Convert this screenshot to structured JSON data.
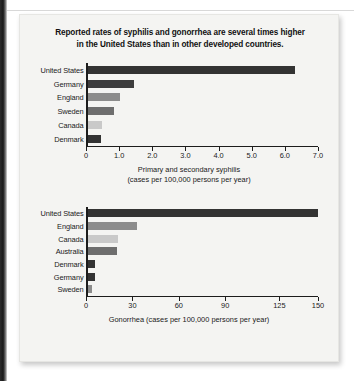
{
  "figure": {
    "title": "Reported rates of syphilis and gonorrhea are several times higher in the United States than in other developed countries.",
    "title_line1": "Reported rates of syphilis and gonorrhea are several times higher",
    "title_line2": "in the United States than in other developed countries."
  },
  "colors": {
    "background_card": "#f4f4f2",
    "page_background": "#ffffff",
    "axis": "#1c1c1c",
    "text": "#1a1a1a",
    "bar_darkest": "#333333",
    "bar_dark": "#3d3d3d",
    "bar_medium": "#8c8c8c",
    "bar_light": "#c9c9c9",
    "bar_mid_dark": "#6e6e6e"
  },
  "chart_data": [
    {
      "id": "syphilis",
      "type": "bar",
      "orientation": "horizontal",
      "title": "",
      "xlabel_line1": "Primary and secondary syphilis",
      "xlabel_line2": "(cases per 100,000 persons per year)",
      "ylabel": "",
      "categories": [
        "United States",
        "Germany",
        "England",
        "Sweden",
        "Canada",
        "Denmark"
      ],
      "values": [
        6.3,
        1.4,
        1.0,
        0.8,
        0.45,
        0.4
      ],
      "bar_colors": [
        "#333333",
        "#3d3d3d",
        "#8c8c8c",
        "#6e6e6e",
        "#c9c9c9",
        "#333333"
      ],
      "xlim": [
        0,
        7.0
      ],
      "xticks": [
        0,
        1.0,
        2.0,
        3.0,
        4.0,
        5.0,
        6.0,
        7.0
      ],
      "xtick_labels": [
        "0",
        "1.0",
        "2.0",
        "3.0",
        "4.0",
        "5.0",
        "6.0",
        "7.0"
      ],
      "grid": false,
      "legend": "none"
    },
    {
      "id": "gonorrhea",
      "type": "bar",
      "orientation": "horizontal",
      "title": "",
      "xlabel_line1": "Gonorrhea (cases per 100,000 persons per year)",
      "xlabel_line2": "",
      "ylabel": "",
      "categories": [
        "United States",
        "England",
        "Canada",
        "Australia",
        "Denmark",
        "Germany",
        "Sweden"
      ],
      "values": [
        150,
        32,
        20,
        19,
        5,
        5,
        3
      ],
      "bar_colors": [
        "#333333",
        "#8c8c8c",
        "#c9c9c9",
        "#6e6e6e",
        "#333333",
        "#333333",
        "#8c8c8c"
      ],
      "xlim": [
        0,
        150
      ],
      "xticks": [
        0,
        30,
        60,
        90,
        125,
        150
      ],
      "xtick_labels": [
        "0",
        "30",
        "60",
        "90",
        "125",
        "150"
      ],
      "grid": false,
      "legend": "none"
    }
  ]
}
